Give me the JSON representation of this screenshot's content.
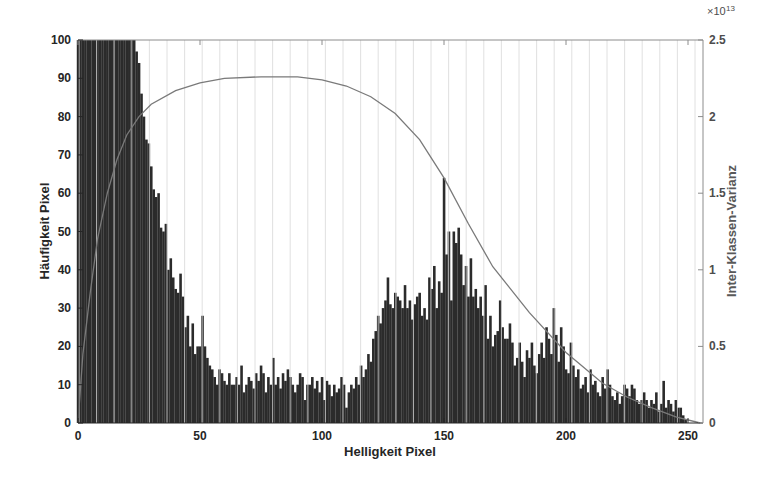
{
  "chart_data": {
    "type": "bar",
    "title": "",
    "xlabel": "Helligkeit Pixel",
    "ylabel": "Häufigkeit Pixel",
    "ylabel_right": "Inter-Klassen-Varianz",
    "right_axis_exponent": "×10",
    "right_axis_exponent_power": "13",
    "xlim": [
      0,
      256
    ],
    "ylim": [
      0,
      100
    ],
    "ylim_right": [
      0,
      2.5
    ],
    "x_ticks": [
      0,
      50,
      100,
      150,
      200,
      250
    ],
    "y_ticks": [
      0,
      10,
      20,
      30,
      40,
      50,
      60,
      70,
      80,
      90,
      100
    ],
    "y_ticks_right": [
      "0",
      "0.5",
      "1",
      "1.5",
      "2",
      "2.5"
    ],
    "grid": false,
    "legend": null,
    "series": [
      {
        "name": "Häufigkeit Pixel (Histogramm)",
        "type": "bar",
        "x_start": 0,
        "values": [
          100,
          100,
          100,
          100,
          100,
          100,
          100,
          100,
          100,
          100,
          100,
          100,
          100,
          100,
          100,
          100,
          100,
          100,
          100,
          100,
          100,
          100,
          100,
          100,
          97,
          94,
          86,
          80,
          74,
          73,
          67,
          61,
          59,
          60,
          51,
          50,
          52,
          40,
          43,
          38,
          35,
          34,
          39,
          33,
          25,
          28,
          20,
          26,
          18,
          20,
          20,
          28,
          20,
          17,
          15,
          14,
          12,
          10,
          14,
          13,
          11,
          10,
          13,
          10,
          10,
          12,
          10,
          15,
          8,
          10,
          12,
          11,
          9,
          13,
          11,
          15,
          13,
          8,
          12,
          10,
          17,
          10,
          12,
          9,
          13,
          11,
          14,
          12,
          10,
          8,
          10,
          13,
          12,
          6,
          10,
          10,
          12,
          9,
          11,
          8,
          12,
          6,
          11,
          10,
          7,
          10,
          8,
          9,
          12,
          10,
          4,
          8,
          10,
          9,
          12,
          10,
          15,
          12,
          14,
          18,
          16,
          22,
          24,
          28,
          26,
          30,
          32,
          38,
          31,
          30,
          34,
          33,
          32,
          30,
          36,
          30,
          32,
          27,
          31,
          33,
          34,
          28,
          30,
          27,
          38,
          35,
          41,
          30,
          37,
          34,
          64,
          44,
          50,
          32,
          50,
          47,
          51,
          44,
          36,
          41,
          33,
          43,
          33,
          35,
          30,
          33,
          28,
          36,
          22,
          28,
          20,
          23,
          24,
          32,
          25,
          22,
          22,
          26,
          21,
          15,
          17,
          21,
          16,
          12,
          19,
          17,
          21,
          15,
          13,
          18,
          21,
          17,
          25,
          22,
          18,
          30,
          23,
          16,
          25,
          20,
          14,
          13,
          21,
          15,
          12,
          14,
          9,
          10,
          12,
          8,
          14,
          10,
          11,
          8,
          7,
          12,
          9,
          14,
          10,
          7,
          6,
          8,
          5,
          7,
          10,
          9,
          7,
          10,
          9,
          6,
          5,
          6,
          8,
          6,
          4,
          6,
          5,
          8,
          3,
          5,
          11,
          4,
          6,
          5,
          3,
          6,
          4,
          4,
          2,
          1,
          0
        ]
      },
      {
        "name": "Inter-Klassen-Varianz",
        "type": "line",
        "axis": "right",
        "x": [
          0,
          2,
          5,
          8,
          12,
          16,
          20,
          25,
          30,
          40,
          50,
          60,
          75,
          90,
          100,
          110,
          120,
          130,
          140,
          150,
          160,
          170,
          185,
          200,
          215,
          225,
          235,
          245,
          255
        ],
        "values": [
          0.0,
          0.45,
          0.85,
          1.2,
          1.5,
          1.72,
          1.88,
          2.0,
          2.08,
          2.17,
          2.22,
          2.25,
          2.26,
          2.26,
          2.24,
          2.2,
          2.13,
          2.02,
          1.85,
          1.6,
          1.3,
          1.02,
          0.72,
          0.46,
          0.26,
          0.17,
          0.1,
          0.04,
          0.0
        ]
      }
    ]
  }
}
